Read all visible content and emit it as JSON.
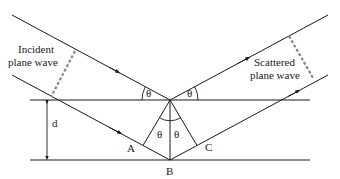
{
  "diagram": {
    "labels": {
      "incident_line1": "Incident",
      "incident_line2": "plane wave",
      "scattered_line1": "Scattered",
      "scattered_line2": "plane wave",
      "spacing": "d",
      "point_a": "A",
      "point_b": "B",
      "point_c": "C",
      "theta": "θ"
    },
    "colors": {
      "line": "#1a1a1a",
      "wavefront": "#888888",
      "background": "#ffffff"
    }
  }
}
